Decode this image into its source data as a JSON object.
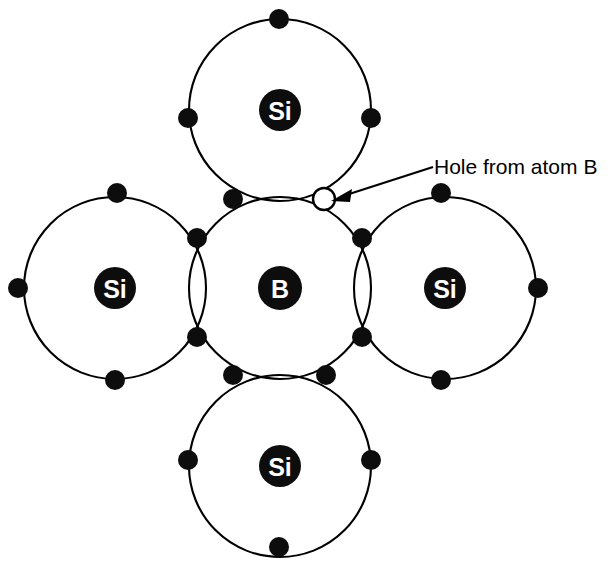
{
  "figure": {
    "background_color": "#ffffff",
    "line_color": "#000000",
    "nucleus_fill": "#0d0d0d",
    "nucleus_text_color": "#ffffff",
    "hole_fill": "#ffffff"
  },
  "atoms": {
    "center": {
      "symbol": "B",
      "cx": 280,
      "cy": 288,
      "orbit_r": 91,
      "nucleus_r": 22
    },
    "top": {
      "symbol": "Si",
      "cx": 280,
      "cy": 110,
      "orbit_r": 91,
      "nucleus_r": 21
    },
    "left": {
      "symbol": "Si",
      "cx": 115,
      "cy": 288,
      "orbit_r": 91,
      "nucleus_r": 21
    },
    "right": {
      "symbol": "Si",
      "cx": 445,
      "cy": 288,
      "orbit_r": 91,
      "nucleus_r": 21
    },
    "bottom": {
      "symbol": "Si",
      "cx": 280,
      "cy": 466,
      "orbit_r": 91,
      "nucleus_r": 21
    }
  },
  "electrons": {
    "radius": 10,
    "shared": [
      {
        "id": "top-left-pair",
        "cx": 233,
        "cy": 199
      },
      {
        "id": "left-top-pair",
        "cx": 197,
        "cy": 238
      },
      {
        "id": "left-bottom-pair",
        "cx": 197,
        "cy": 337
      },
      {
        "id": "bottom-left-pair",
        "cx": 233,
        "cy": 375
      },
      {
        "id": "bottom-right-pair",
        "cx": 326,
        "cy": 375
      },
      {
        "id": "right-bottom-pair",
        "cx": 362,
        "cy": 337
      },
      {
        "id": "right-top-pair",
        "cx": 362,
        "cy": 238
      }
    ],
    "outer": [
      {
        "id": "top-si-top",
        "cx": 279,
        "cy": 19
      },
      {
        "id": "top-si-left",
        "cx": 188,
        "cy": 118
      },
      {
        "id": "top-si-right",
        "cx": 371,
        "cy": 118
      },
      {
        "id": "left-si-top",
        "cx": 117,
        "cy": 193
      },
      {
        "id": "left-si-left",
        "cx": 18,
        "cy": 288
      },
      {
        "id": "left-si-bottom",
        "cx": 115,
        "cy": 380
      },
      {
        "id": "right-si-top",
        "cx": 441,
        "cy": 193
      },
      {
        "id": "right-si-right",
        "cx": 538,
        "cy": 288
      },
      {
        "id": "right-si-bottom",
        "cx": 441,
        "cy": 380
      },
      {
        "id": "bottom-si-left",
        "cx": 188,
        "cy": 460
      },
      {
        "id": "bottom-si-right",
        "cx": 371,
        "cy": 460
      },
      {
        "id": "bottom-si-bottom",
        "cx": 279,
        "cy": 547
      }
    ]
  },
  "hole": {
    "id": "hole-from-atom-b",
    "cx": 324,
    "cy": 199,
    "radius": 11
  },
  "callout": {
    "text": "Hole from atom B",
    "text_x": 434,
    "text_y": 174,
    "leader_start_x": 433,
    "leader_start_y": 167,
    "leader_end_x": 341,
    "leader_end_y": 197,
    "arrow_tip_x": 330,
    "arrow_tip_y": 201
  },
  "counts": {
    "silicon_atoms": 4,
    "boron_atoms": 1,
    "holes": 1,
    "shared_electron_pairs": 7,
    "outer_electrons": 12
  }
}
